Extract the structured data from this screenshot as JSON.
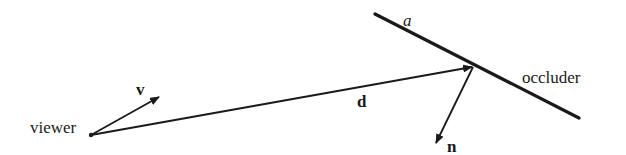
{
  "diagram": {
    "labels": {
      "viewer": "viewer",
      "view_vector": "v",
      "direction_vector": "d",
      "occluder_param": "a",
      "occluder": "occluder",
      "normal_vector": "n"
    },
    "colors": {
      "stroke": "#1a1a1a",
      "background": "#ffffff"
    },
    "elements": [
      {
        "id": "viewer-point",
        "type": "point",
        "at": [
          91,
          135
        ]
      },
      {
        "id": "v",
        "type": "arrow",
        "from": [
          91,
          135
        ],
        "to": [
          159,
          97
        ],
        "style": "bold"
      },
      {
        "id": "d",
        "type": "arrow",
        "from": [
          91,
          135
        ],
        "to": [
          473,
          67
        ],
        "style": "bold"
      },
      {
        "id": "occluder",
        "type": "line",
        "from": [
          375,
          14
        ],
        "to": [
          579,
          118
        ]
      },
      {
        "id": "n",
        "type": "arrow",
        "from": [
          473,
          67
        ],
        "to": [
          436,
          143
        ],
        "style": "bold"
      }
    ]
  }
}
